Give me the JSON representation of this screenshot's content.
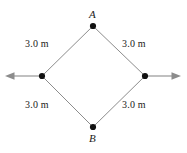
{
  "figure": {
    "background_color": "#ffffff",
    "line_color": "#8c8c8c",
    "dot_color": "#111111",
    "text_color": "#1a1a1a"
  },
  "vertices": [
    {
      "id": "A",
      "label": "A",
      "position": "top",
      "x": 93,
      "y": 26,
      "label_x": 89,
      "label_y": 9
    },
    {
      "id": "B",
      "label": "B",
      "position": "bottom",
      "x": 93,
      "y": 127,
      "label_x": 89,
      "label_y": 133
    },
    {
      "id": "L",
      "label": "",
      "position": "left",
      "x": 42,
      "y": 76,
      "label_x": 0,
      "label_y": 0
    },
    {
      "id": "R",
      "label": "",
      "position": "right",
      "x": 145,
      "y": 76,
      "label_x": 0,
      "label_y": 0
    }
  ],
  "segments": [
    {
      "id": "top-left",
      "from": "L",
      "to": "A",
      "length_label": "3.0 m"
    },
    {
      "id": "top-right",
      "from": "A",
      "to": "R",
      "length_label": "3.0 m"
    },
    {
      "id": "bottom-left",
      "from": "L",
      "to": "B",
      "length_label": "3.0 m"
    },
    {
      "id": "bottom-right",
      "from": "B",
      "to": "R",
      "length_label": "3.0 m"
    }
  ],
  "length_labels": {
    "top_left": "3.0 m",
    "top_right": "3.0 m",
    "bottom_left": "3.0 m",
    "bottom_right": "3.0 m"
  },
  "force_arrows": [
    {
      "id": "left-arrow",
      "direction": "left",
      "from_x": 42,
      "from_y": 76,
      "to_x": 6,
      "to_y": 76,
      "label": ""
    },
    {
      "id": "right-arrow",
      "direction": "right",
      "from_x": 145,
      "from_y": 76,
      "to_x": 180,
      "to_y": 76,
      "label": ""
    }
  ]
}
